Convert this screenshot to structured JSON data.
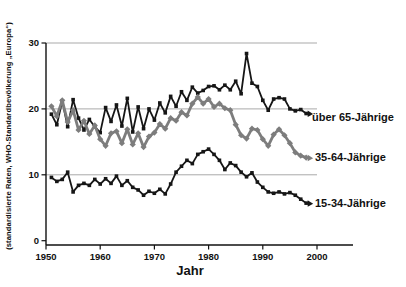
{
  "chart_data": {
    "type": "line",
    "title": "",
    "xlabel": "Jahr",
    "ylabel": "(standardisierte Raten, WHO-Standardbevölkerung „Europa“)",
    "xlim": [
      1950,
      2000
    ],
    "ylim": [
      0,
      30
    ],
    "x_ticks": [
      1950,
      1960,
      1970,
      1980,
      1990,
      2000
    ],
    "y_ticks": [
      0,
      10,
      20,
      30
    ],
    "grid": "horizontal gridlines at 10, 20, 30",
    "legend_position": "right of line ends, direct labels with arrows",
    "x": [
      1951,
      1952,
      1953,
      1954,
      1955,
      1956,
      1957,
      1958,
      1959,
      1960,
      1961,
      1962,
      1963,
      1964,
      1965,
      1966,
      1967,
      1968,
      1969,
      1970,
      1971,
      1972,
      1973,
      1974,
      1975,
      1976,
      1977,
      1978,
      1979,
      1980,
      1981,
      1982,
      1983,
      1984,
      1985,
      1986,
      1987,
      1988,
      1989,
      1990,
      1991,
      1992,
      1993,
      1994,
      1995,
      1996,
      1997,
      1998
    ],
    "series": [
      {
        "name": "über 65-Jährige",
        "color": "#161616",
        "marker": "square",
        "line_width": 1.8,
        "values": [
          19.2,
          17.6,
          21.2,
          17.3,
          21.4,
          18.6,
          16.8,
          18.4,
          17.3,
          16.4,
          20.2,
          18.1,
          20.6,
          17.4,
          21.6,
          16.5,
          20.3,
          17.0,
          20.0,
          18.3,
          20.9,
          19.4,
          21.9,
          20.4,
          22.6,
          21.3,
          23.3,
          22.4,
          22.8,
          23.4,
          23.5,
          22.9,
          23.6,
          22.9,
          24.2,
          22.3,
          28.4,
          23.9,
          23.4,
          21.3,
          19.8,
          21.5,
          21.7,
          21.5,
          20.0,
          19.7,
          19.9,
          19.3
        ]
      },
      {
        "name": "35-64-Jährige",
        "color": "#7d7d7d",
        "marker": "diamond",
        "line_width": 2.8,
        "values": [
          20.4,
          18.9,
          21.3,
          18.0,
          19.8,
          16.8,
          18.2,
          16.2,
          17.5,
          15.4,
          14.4,
          16.3,
          16.6,
          14.8,
          16.9,
          14.6,
          16.3,
          14.2,
          15.8,
          16.4,
          17.7,
          17.0,
          18.6,
          18.2,
          19.5,
          19.0,
          20.8,
          21.8,
          20.8,
          21.5,
          20.3,
          20.8,
          20.1,
          19.8,
          17.6,
          16.0,
          15.5,
          17.0,
          16.8,
          15.4,
          14.4,
          16.1,
          16.9,
          16.0,
          14.8,
          13.4,
          12.9,
          12.6
        ]
      },
      {
        "name": "15-34-Jährige",
        "color": "#161616",
        "marker": "square",
        "line_width": 1.8,
        "values": [
          9.6,
          9.0,
          9.3,
          10.4,
          7.4,
          8.4,
          8.7,
          8.4,
          9.3,
          8.6,
          9.4,
          8.7,
          9.8,
          8.4,
          9.1,
          8.1,
          7.7,
          6.9,
          7.5,
          7.2,
          7.8,
          7.1,
          8.6,
          10.4,
          11.3,
          12.2,
          11.7,
          13.1,
          13.5,
          13.9,
          13.1,
          12.2,
          10.8,
          11.8,
          11.4,
          10.4,
          9.7,
          10.3,
          8.9,
          8.1,
          7.4,
          7.2,
          7.4,
          7.1,
          7.3,
          6.9,
          6.3,
          5.7
        ]
      }
    ],
    "style": {
      "axis_color": "#111111",
      "grid_color": "#9f9f9f",
      "background": "#ffffff"
    }
  }
}
